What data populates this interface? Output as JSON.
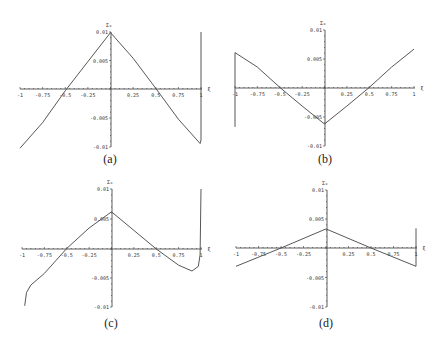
{
  "chart_data": [
    {
      "type": "line",
      "panel": "(a)",
      "title": "",
      "xlabel": "ξ",
      "ylabel": "Σ₀",
      "xlim": [
        -1,
        1
      ],
      "ylim": [
        -0.01,
        0.01
      ],
      "xticks": [
        "-1",
        "-0.75",
        "-0.5",
        "-0.25",
        "0.25",
        "0.5",
        "0.75",
        "1"
      ],
      "yticks": [
        "0.01",
        "0.005",
        "-0.005",
        "-0.01"
      ],
      "x": [
        -1,
        -0.75,
        -0.5,
        -0.25,
        0,
        0.25,
        0.5,
        0.75,
        0.99,
        1,
        1
      ],
      "y": [
        -0.0102,
        -0.0058,
        -0.0003,
        0.0048,
        0.0099,
        0.0054,
        0.0001,
        -0.0052,
        -0.0094,
        -0.0088,
        0.01
      ],
      "caption": "(a)"
    },
    {
      "type": "line",
      "panel": "(b)",
      "title": "",
      "xlabel": "ξ",
      "ylabel": "Σ₀",
      "xlim": [
        -1,
        1
      ],
      "ylim": [
        -0.01,
        0.01
      ],
      "xticks": [
        "-1",
        "-0.75",
        "-0.5",
        "-0.25",
        "0.25",
        "0.5",
        "0.75",
        "1"
      ],
      "yticks": [
        "0.01",
        "0.005",
        "-0.005",
        "-0.01"
      ],
      "x": [
        -1,
        -1,
        -0.75,
        -0.5,
        -0.25,
        0,
        0.25,
        0.5,
        0.75,
        1
      ],
      "y": [
        -0.0067,
        0.0061,
        0.0036,
        0.0001,
        -0.0031,
        -0.0062,
        -0.0031,
        0.0001,
        0.0036,
        0.0067
      ],
      "caption": "(b)"
    },
    {
      "type": "line",
      "panel": "(c)",
      "title": "",
      "xlabel": "ξ",
      "ylabel": "Σ₀",
      "xlim": [
        -1,
        1
      ],
      "ylim": [
        -0.01,
        0.01
      ],
      "xticks": [
        "-1",
        "-0.75",
        "-0.5",
        "-0.25",
        "0.25",
        "0.5",
        "0.75",
        "1"
      ],
      "yticks": [
        "0.01",
        "0.005",
        "-0.005",
        "-0.01"
      ],
      "x": [
        -0.97,
        -0.95,
        -0.9,
        -0.75,
        -0.5,
        -0.25,
        0,
        0.25,
        0.5,
        0.75,
        0.9,
        0.97,
        0.99,
        1
      ],
      "y": [
        -0.0098,
        -0.0075,
        -0.0062,
        -0.0042,
        0.0001,
        0.0035,
        0.0062,
        0.0031,
        0.0,
        -0.0028,
        -0.0038,
        -0.003,
        -0.001,
        0.01
      ],
      "caption": "(c)"
    },
    {
      "type": "line",
      "panel": "(d)",
      "title": "",
      "xlabel": "ξ",
      "ylabel": "Σ₀",
      "xlim": [
        -1,
        1
      ],
      "ylim": [
        -0.01,
        0.01
      ],
      "xticks": [
        "-1",
        "-0.75",
        "-0.5",
        "-0.25",
        "0.25",
        "0.5",
        "0.75",
        "1"
      ],
      "yticks": [
        "0.01",
        "0.005",
        "-0.005",
        "-0.01"
      ],
      "x": [
        -1,
        -0.5,
        0,
        0.5,
        1,
        1
      ],
      "y": [
        -0.0031,
        0.0,
        0.0033,
        0.0,
        -0.0031,
        0.0034
      ],
      "caption": "(d)"
    }
  ],
  "panels": {
    "a": {
      "caption": "(a)",
      "ylabel": "Σ₀",
      "xlabel": "ξ"
    },
    "b": {
      "caption": "(b)",
      "ylabel": "Σ₀",
      "xlabel": "ξ"
    },
    "c": {
      "caption": "(c)",
      "ylabel": "Σ₀",
      "xlabel": "ξ"
    },
    "d": {
      "caption": "(d)",
      "ylabel": "Σ₀",
      "xlabel": "ξ"
    }
  },
  "ticks": {
    "x": [
      "-1",
      "-0.75",
      "-0.5",
      "-0.25",
      "0.25",
      "0.5",
      "0.75",
      "1"
    ],
    "y": [
      "0.01",
      "0.005",
      "-0.005",
      "-0.01"
    ]
  }
}
